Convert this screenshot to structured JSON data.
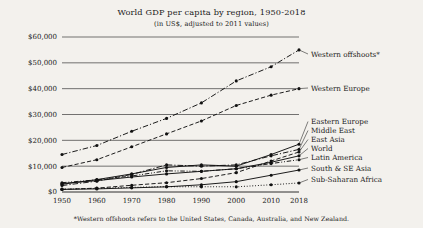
{
  "chart_data": {
    "type": "line",
    "title": "World GDP per capita by region, 1950-2018",
    "subtitle": "(in US$, adjusted to 2011 values)",
    "footnote": "*Western offshoots refers to the United States, Canada, Australia, and New Zealand.",
    "xlabel": "",
    "ylabel": "",
    "grid": true,
    "legend_position": "right-inline-labels",
    "x": [
      1950,
      1960,
      1970,
      1980,
      1990,
      2000,
      2010,
      2018
    ],
    "xtick_labels": [
      "1950",
      "1960",
      "1970",
      "1980",
      "1990",
      "2000",
      "2010",
      "2018"
    ],
    "xlim": [
      1950,
      2018
    ],
    "ylim": [
      0,
      60000
    ],
    "ytick_values": [
      0,
      10000,
      20000,
      30000,
      40000,
      50000,
      60000
    ],
    "ytick_labels": [
      "$0",
      "$10,000",
      "$20,000",
      "$30,000",
      "$40,000",
      "$50,000",
      "$60,000"
    ],
    "series": [
      {
        "name": "Western offshoots*",
        "label": "Western offshoots*",
        "style": "dash-dot",
        "values": [
          14500,
          18000,
          23500,
          28500,
          34500,
          43000,
          48500,
          55000
        ]
      },
      {
        "name": "Western Europe",
        "label": "Western Europe",
        "style": "dashed",
        "values": [
          9500,
          12500,
          17500,
          22500,
          27500,
          33500,
          37500,
          40000
        ]
      },
      {
        "name": "Eastern Europe",
        "label": "Eastern Europe",
        "style": "solid",
        "values": [
          3000,
          4800,
          7000,
          9500,
          10500,
          10000,
          14500,
          18500
        ]
      },
      {
        "name": "Middle East",
        "label": "Middle East",
        "style": "dash-dot",
        "values": [
          2500,
          4200,
          6800,
          10500,
          10000,
          10500,
          14000,
          16500
        ]
      },
      {
        "name": "East Asia",
        "label": "East Asia",
        "style": "dashed",
        "values": [
          1000,
          1500,
          2600,
          3600,
          5200,
          7500,
          12000,
          15500
        ]
      },
      {
        "name": "World",
        "label": "World",
        "style": "solid",
        "values": [
          3300,
          4400,
          5800,
          7000,
          8000,
          9000,
          11500,
          14000
        ]
      },
      {
        "name": "Latin America",
        "label": "Latin America",
        "style": "dash-dot-dot",
        "values": [
          3600,
          4700,
          6200,
          8200,
          8000,
          9000,
          11000,
          12500
        ]
      },
      {
        "name": "South & SE Asia",
        "label": "South & SE Asia",
        "style": "solid",
        "values": [
          1000,
          1200,
          1600,
          2000,
          2800,
          4000,
          6500,
          8500
        ]
      },
      {
        "name": "Sub-Saharan Africa",
        "label": "Sub-Saharan Africa",
        "style": "dotted",
        "values": [
          1100,
          1400,
          1800,
          2100,
          2000,
          2000,
          2800,
          3500
        ]
      }
    ]
  }
}
